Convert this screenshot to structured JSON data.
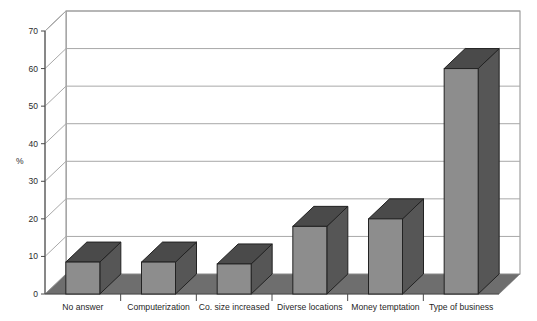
{
  "chart_data": {
    "type": "bar",
    "title": "",
    "subtitle": "",
    "xlabel": "",
    "ylabel": "%",
    "ylim": [
      0,
      70
    ],
    "ytick_interval": 10,
    "yticks": [
      "0",
      "10",
      "20",
      "30",
      "40",
      "50",
      "60",
      "70"
    ],
    "grid": true,
    "legend": "none",
    "three_d": true,
    "categories": [
      "No answer",
      "Computerization",
      "Co. size increased",
      "Diverse locations",
      "Money temptation",
      "Type of business"
    ],
    "values": [
      8.5,
      8.5,
      8,
      18,
      20,
      60
    ],
    "series": [
      {
        "name": "Percent of respondents",
        "values": [
          8.5,
          8.5,
          8,
          18,
          20,
          60
        ]
      }
    ]
  },
  "colors": {
    "bar_front": "#8d8d8d",
    "bar_side": "#565656",
    "bar_top": "#4a4a4a",
    "bar_outline": "#222222",
    "floor": "#6e6e6e",
    "wall": "#ffffff",
    "wall_outline": "#8a8a8a",
    "gridline": "#a8a8a8",
    "axis_line": "#4a4a4a",
    "text": "#1f1f1f",
    "background": "#ffffff"
  },
  "axis": {
    "y_title": "%",
    "y_tick_labels": [
      "70",
      "60",
      "50",
      "40",
      "30",
      "20",
      "10",
      "0"
    ]
  }
}
